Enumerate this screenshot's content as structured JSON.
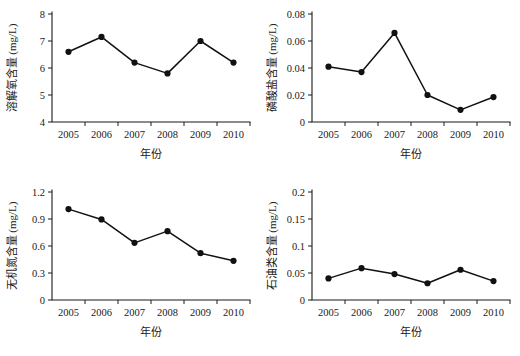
{
  "figure": {
    "layout": "2x2 grid of line charts",
    "background_color": "#ffffff",
    "line_color": "#111111",
    "marker_color": "#111111",
    "axis_color": "#1a1a1a"
  },
  "chart_data": [
    {
      "type": "line",
      "panel": "top-left",
      "title": "",
      "xlabel": "年份",
      "ylabel": "溶解氧含量 (mg/L)",
      "categories": [
        "2005",
        "2006",
        "2007",
        "2008",
        "2009",
        "2010"
      ],
      "x": [
        2005,
        2006,
        2007,
        2008,
        2009,
        2010
      ],
      "values": [
        6.6,
        7.15,
        6.2,
        5.8,
        7.0,
        6.2
      ],
      "ylim": [
        4,
        8
      ],
      "yticks": [
        "4",
        "5",
        "6",
        "7",
        "8"
      ],
      "ytick_values": [
        4,
        5,
        6,
        7,
        8
      ],
      "xticks": [
        "2005",
        "2006",
        "2007",
        "2008",
        "2009",
        "2010"
      ],
      "grid": false,
      "legend": "none",
      "marker": "filled-circle"
    },
    {
      "type": "line",
      "panel": "top-right",
      "title": "",
      "xlabel": "年份",
      "ylabel": "磷酸盐含量 (mg/L)",
      "categories": [
        "2005",
        "2006",
        "2007",
        "2008",
        "2009",
        "2010"
      ],
      "x": [
        2005,
        2006,
        2007,
        2008,
        2009,
        2010
      ],
      "values": [
        0.041,
        0.037,
        0.066,
        0.02,
        0.009,
        0.0185
      ],
      "ylim": [
        0,
        0.08
      ],
      "yticks": [
        "0",
        "0.02",
        "0.04",
        "0.06",
        "0.08"
      ],
      "ytick_values": [
        0,
        0.02,
        0.04,
        0.06,
        0.08
      ],
      "xticks": [
        "2005",
        "2006",
        "2007",
        "2008",
        "2009",
        "2010"
      ],
      "grid": false,
      "legend": "none",
      "marker": "filled-circle"
    },
    {
      "type": "line",
      "panel": "bottom-left",
      "title": "",
      "xlabel": "年份",
      "ylabel": "无机氮含量 (mg/L)",
      "categories": [
        "2005",
        "2006",
        "2007",
        "2008",
        "2009",
        "2010"
      ],
      "x": [
        2005,
        2006,
        2007,
        2008,
        2009,
        2010
      ],
      "values": [
        1.01,
        0.895,
        0.635,
        0.765,
        0.52,
        0.435
      ],
      "ylim": [
        0,
        1.2
      ],
      "yticks": [
        "0",
        "0.3",
        "0.6",
        "0.9",
        "1.2"
      ],
      "ytick_values": [
        0,
        0.3,
        0.6,
        0.9,
        1.2
      ],
      "xticks": [
        "2005",
        "2006",
        "2007",
        "2008",
        "2009",
        "2010"
      ],
      "grid": false,
      "legend": "none",
      "marker": "filled-circle"
    },
    {
      "type": "line",
      "panel": "bottom-right",
      "title": "",
      "xlabel": "年份",
      "ylabel": "石油类含量 (mg/L)",
      "categories": [
        "2005",
        "2006",
        "2007",
        "2008",
        "2009",
        "2010"
      ],
      "x": [
        2005,
        2006,
        2007,
        2008,
        2009,
        2010
      ],
      "values": [
        0.04,
        0.059,
        0.048,
        0.031,
        0.056,
        0.035
      ],
      "ylim": [
        0,
        0.2
      ],
      "yticks": [
        "0",
        "0.05",
        "0.1",
        "0.15",
        "0.2"
      ],
      "ytick_values": [
        0,
        0.05,
        0.1,
        0.15,
        0.2
      ],
      "xticks": [
        "2005",
        "2006",
        "2007",
        "2008",
        "2009",
        "2010"
      ],
      "grid": false,
      "legend": "none",
      "marker": "filled-circle"
    }
  ]
}
